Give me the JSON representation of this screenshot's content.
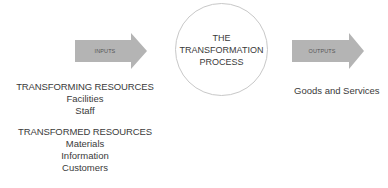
{
  "diagram": {
    "title_circle": {
      "lines": [
        "THE",
        "TRANSFORMATION",
        "PROCESS"
      ]
    },
    "inputs_arrow": {
      "label": "INPUTS",
      "color": "#b4b4b4"
    },
    "outputs_arrow": {
      "label": "OUTPUTS",
      "color": "#b4b4b4"
    },
    "transforming_resources": {
      "heading": "TRANSFORMING RESOURCES",
      "items": [
        "Facilities",
        "Staff"
      ]
    },
    "transformed_resources": {
      "heading": "TRANSFORMED RESOURCES",
      "items": [
        "Materials",
        "Information",
        "Customers"
      ]
    },
    "outputs": {
      "text": "Goods and Services"
    }
  }
}
